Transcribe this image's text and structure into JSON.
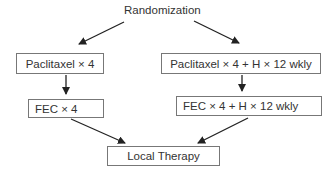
{
  "diagram": {
    "type": "flowchart",
    "root": {
      "label": "Randomization"
    },
    "nodes": [
      {
        "id": "arm1_step1",
        "label": "Paclitaxel × 4"
      },
      {
        "id": "arm2_step1",
        "label": "Paclitaxel × 4 + H × 12 wkly"
      },
      {
        "id": "arm1_step2",
        "label": "FEC × 4"
      },
      {
        "id": "arm2_step2",
        "label": "FEC × 4 + H × 12 wkly"
      },
      {
        "id": "final",
        "label": "Local Therapy"
      }
    ],
    "edges": [
      [
        "root",
        "arm1_step1"
      ],
      [
        "root",
        "arm2_step1"
      ],
      [
        "arm1_step1",
        "arm1_step2"
      ],
      [
        "arm2_step1",
        "arm2_step2"
      ],
      [
        "arm1_step2",
        "final"
      ],
      [
        "arm2_step2",
        "final"
      ]
    ],
    "colors": {
      "line": "#222222",
      "box_border": "#777777",
      "text": "#333333"
    }
  }
}
